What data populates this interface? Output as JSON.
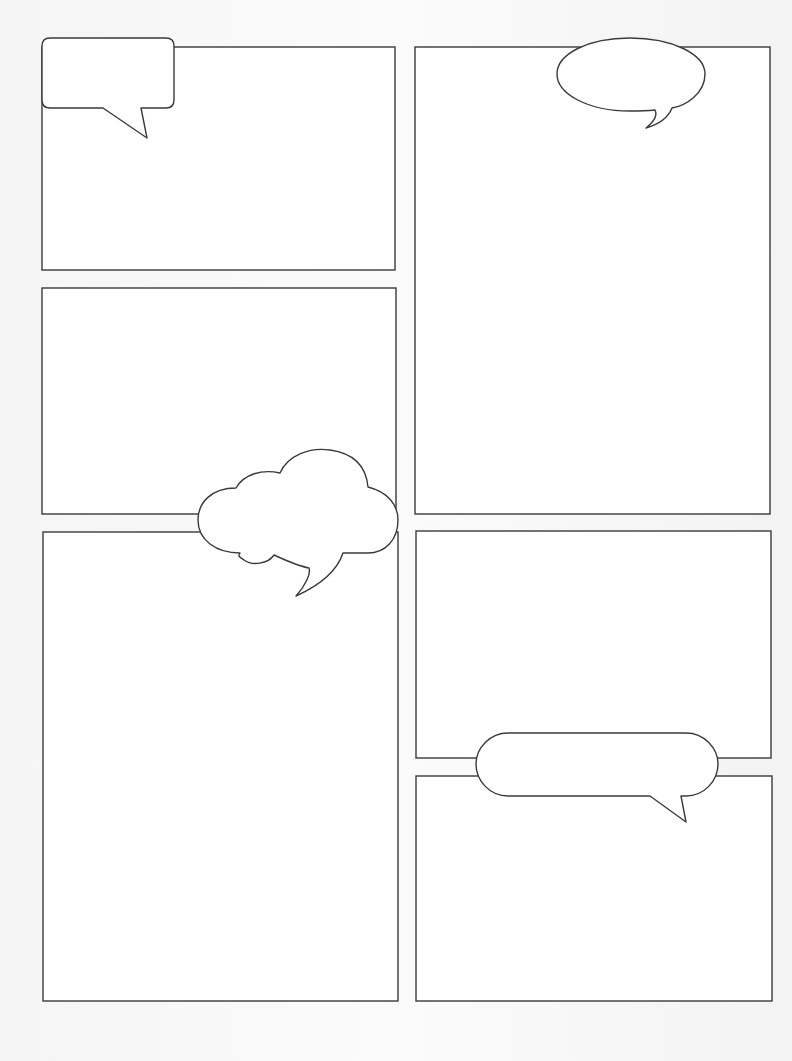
{
  "page": {
    "type": "blank comic page template",
    "background_color": "#f4f4f4",
    "line_color": "#3a3a3a",
    "panel_fill": "#ffffff"
  },
  "panels": [
    {
      "id": "panel-1",
      "position": "top-left",
      "x": 42,
      "y": 47,
      "w": 353,
      "h": 223
    },
    {
      "id": "panel-2",
      "position": "middle-left",
      "x": 42,
      "y": 288,
      "w": 354,
      "h": 226
    },
    {
      "id": "panel-3",
      "position": "bottom-left",
      "x": 43,
      "y": 532,
      "w": 355,
      "h": 469
    },
    {
      "id": "panel-4",
      "position": "top-right",
      "x": 415,
      "y": 47,
      "w": 355,
      "h": 467
    },
    {
      "id": "panel-5",
      "position": "middle-right",
      "x": 416,
      "y": 531,
      "w": 355,
      "h": 227
    },
    {
      "id": "panel-6",
      "position": "bottom-right",
      "x": 416,
      "y": 776,
      "w": 356,
      "h": 225
    }
  ],
  "bubbles": [
    {
      "id": "rectangle-speech-bubble",
      "shape": "rounded rectangle",
      "text": ""
    },
    {
      "id": "oval-speech-bubble",
      "shape": "ellipse",
      "text": ""
    },
    {
      "id": "thought-cloud-bubble",
      "shape": "cloud",
      "text": ""
    },
    {
      "id": "pill-speech-bubble",
      "shape": "pill",
      "text": ""
    }
  ]
}
